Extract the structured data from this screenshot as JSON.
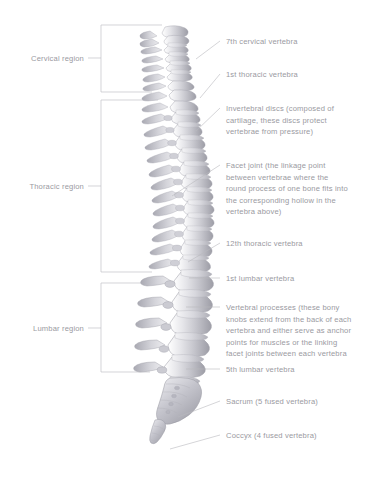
{
  "figure": {
    "background_color": "#ffffff",
    "text_color": "#9a9a9f",
    "line_color": "#b9b9be",
    "bone_color": "#c9c9cf"
  },
  "regions": [
    {
      "id": "cervical",
      "label": "Cervical region"
    },
    {
      "id": "thoracic",
      "label": "Thoracic region"
    },
    {
      "id": "lumbar",
      "label": "Lumbar region"
    }
  ],
  "callouts": [
    {
      "id": "c7",
      "text": "7th cervical vertebra"
    },
    {
      "id": "t1",
      "text": "1st thoracic vertebra"
    },
    {
      "id": "discs",
      "text": "Invertebral discs (composed of\ncartilage, these discs protect\nvertebrae from pressure)"
    },
    {
      "id": "facet",
      "text": "Facet joint (the linkage point\nbetween vertebrae where the\nround process of one bone fits into\nthe corresponding hollow in the\nvertebra above)"
    },
    {
      "id": "t12",
      "text": "12th thoracic vertebra"
    },
    {
      "id": "l1",
      "text": "1st lumbar vertebra"
    },
    {
      "id": "processes",
      "text": "Vertebral processes (these bony\nknobs extend from the back of each\nvertebra and either serve as anchor\npoints for muscles or the linking\nfacet joints between each vertebra"
    },
    {
      "id": "l5",
      "text": "5th lumbar vertebra"
    },
    {
      "id": "sacrum",
      "text": "Sacrum (5 fused vertebra)"
    },
    {
      "id": "coccyx",
      "text": "Coccyx (4 fused vertebra)"
    }
  ]
}
